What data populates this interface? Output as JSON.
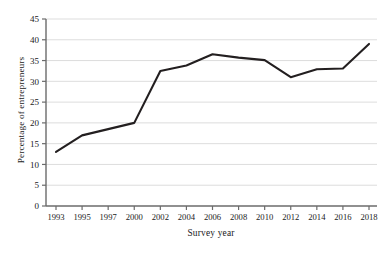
{
  "chart_data": {
    "type": "line",
    "title": "",
    "xlabel": "Survey year",
    "ylabel": "Percentage of entrepreneurs",
    "categories": [
      "1993",
      "1995",
      "1997",
      "2000",
      "2002",
      "2004",
      "2006",
      "2008",
      "2010",
      "2012",
      "2014",
      "2016",
      "2018"
    ],
    "values": [
      13,
      17,
      18.5,
      20,
      32.5,
      33.8,
      36.5,
      35.7,
      35.1,
      31,
      32.9,
      33.1,
      39
    ],
    "series": [
      {
        "name": "Percentage of entrepreneurs",
        "values": [
          13,
          17,
          18.5,
          20,
          32.5,
          33.8,
          36.5,
          35.7,
          35.1,
          31,
          32.9,
          33.1,
          39
        ],
        "color": "#231f20"
      }
    ],
    "ylim": [
      0,
      45
    ],
    "ytick_step": 5,
    "yticks": [
      "0",
      "5",
      "10",
      "15",
      "20",
      "25",
      "30",
      "35",
      "40",
      "45"
    ],
    "xlim_categorical": true,
    "grid": "horizontal",
    "grid_color": "#d9d9d9",
    "legend": "none",
    "line_color": "#231f20",
    "line_width": 2.1,
    "axis_color": "#6b6b6b",
    "background": "#ffffff"
  }
}
